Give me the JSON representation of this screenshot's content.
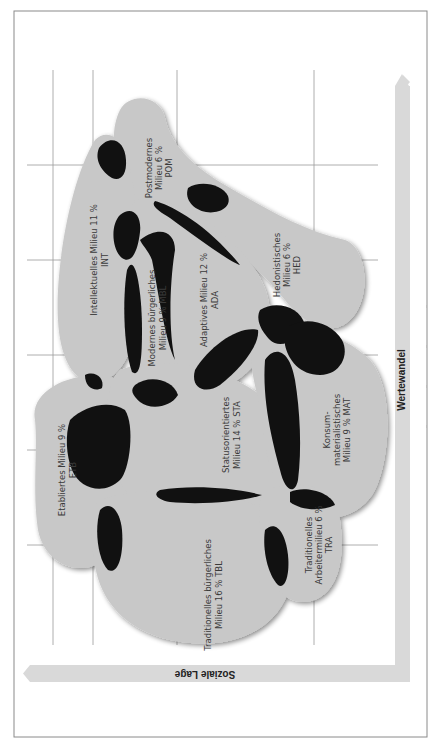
{
  "diagram": {
    "type": "sinus-milieus-map",
    "orientation": "rotated 90deg clockwise",
    "axes": {
      "y_axis_label": "Soziale Lage",
      "x_axis_label": "Wertewandel"
    },
    "milieus": [
      {
        "id": "POM",
        "line1": "Postmodernes",
        "line2": "Milieu 6 %",
        "line3": "POM",
        "percent": 6
      },
      {
        "id": "INT",
        "line1": "Intellektuelles Milieu 11 %",
        "line2": "INT",
        "line3": "",
        "percent": 11
      },
      {
        "id": "MBL",
        "line1": "Modernes bürgerliches",
        "line2": "Milieu 9 % MBL",
        "line3": "",
        "percent": 9
      },
      {
        "id": "ADA",
        "line1": "Adaptives Milieu 12 %",
        "line2": "ADA",
        "line3": "",
        "percent": 12
      },
      {
        "id": "HED",
        "line1": "Hedonistisches",
        "line2": "Milieu 6 %",
        "line3": "HED",
        "percent": 6
      },
      {
        "id": "ETB",
        "line1": "Etabliertes Milieu 9 %",
        "line2": "ETB",
        "line3": "",
        "percent": 9
      },
      {
        "id": "STA",
        "line1": "Statusorientiertes",
        "line2": "Milieu 14 % STA",
        "line3": "",
        "percent": 14
      },
      {
        "id": "MAT",
        "line1": "Konsum-",
        "line2": "materialistisches",
        "line3": "Milieu 9 % MAT",
        "percent": 9
      },
      {
        "id": "TBL",
        "line1": "Traditionelles bürgerliches",
        "line2": "Milieu 16 % TBL",
        "line3": "",
        "percent": 16
      },
      {
        "id": "TRA",
        "line1": "Traditionelles",
        "line2": "Arbeitermilieu 6 %",
        "line3": "TRA",
        "percent": 6
      }
    ],
    "colors": {
      "milieu_fill": "#c8c8c8",
      "overlap_fill": "#111111",
      "axis_arrow": "#d9d9d9",
      "grid": "#9a9a9a",
      "frame": "#8a8a8a"
    }
  }
}
